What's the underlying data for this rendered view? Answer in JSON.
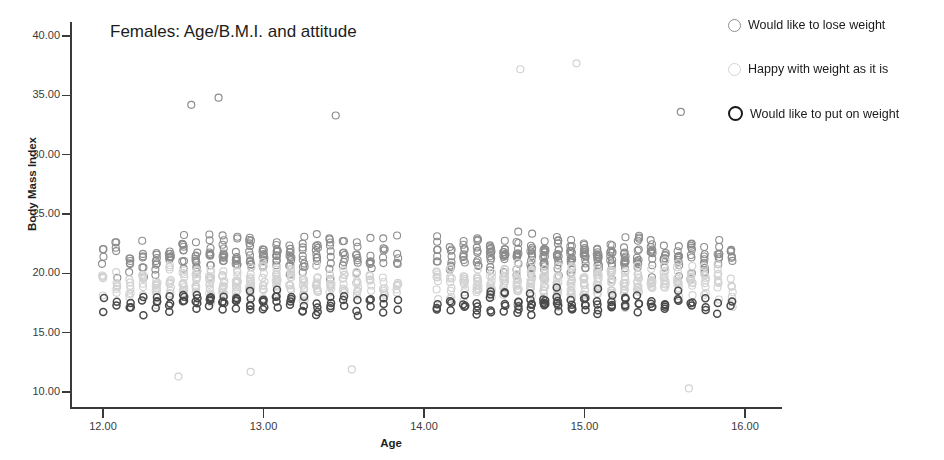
{
  "chart_data": {
    "type": "scatter",
    "title": "Females: Age/B.M.I. and attitude",
    "xlabel": "Age",
    "ylabel": "Body Mass Index",
    "xlim": [
      11.75,
      16.1
    ],
    "ylim": [
      9.0,
      41.5
    ],
    "xticks": [
      "12.00",
      "13.00",
      "14.00",
      "15.00",
      "16.00"
    ],
    "xtick_values": [
      12,
      13,
      14,
      15,
      16
    ],
    "yticks": [
      "10.00",
      "15.00",
      "20.00",
      "25.00",
      "30.00",
      "35.00",
      "40.00"
    ],
    "ytick_values": [
      10,
      15,
      20,
      25,
      30,
      35,
      40
    ],
    "grid": false,
    "legend_position": "right",
    "legend": [
      {
        "label": "Would like to lose weight",
        "marker": "open-circle",
        "color": "#8d8d8d"
      },
      {
        "label": "Happy with weight as it is",
        "marker": "open-circle",
        "color": "#d2d2d2"
      },
      {
        "label": "Would like to put on weight",
        "marker": "open-circle-bold",
        "color": "#1a1a1a"
      }
    ],
    "series": [
      {
        "name": "Would like to lose weight",
        "color": "#8d8d8d",
        "marker_size": 7,
        "n": 470,
        "x_column_centres": [
          12.0,
          12.083,
          12.167,
          12.25,
          12.333,
          12.417,
          12.5,
          12.583,
          12.667,
          12.75,
          12.833,
          12.917,
          13.0,
          13.083,
          13.167,
          13.25,
          13.333,
          13.417,
          13.5,
          13.583,
          13.667,
          13.75,
          13.833,
          14.083,
          14.167,
          14.25,
          14.333,
          14.417,
          14.5,
          14.583,
          14.667,
          14.75,
          14.833,
          14.917,
          15.0,
          15.083,
          15.167,
          15.25,
          15.333,
          15.417,
          15.5,
          15.583,
          15.667,
          15.75,
          15.833,
          15.917
        ],
        "counts_per_column": [
          4,
          5,
          6,
          7,
          8,
          9,
          10,
          11,
          11,
          12,
          12,
          13,
          12,
          12,
          11,
          10,
          10,
          9,
          8,
          8,
          7,
          6,
          5,
          7,
          8,
          9,
          10,
          12,
          13,
          14,
          15,
          16,
          16,
          15,
          15,
          14,
          14,
          13,
          13,
          12,
          11,
          11,
          10,
          9,
          8,
          6
        ],
        "y_range_per_column": [
          17.0,
          31.0
        ],
        "y_median_approx": 21.5
      },
      {
        "name": "Happy with weight as it is",
        "color": "#d2d2d2",
        "marker_size": 7,
        "n": 560,
        "x_column_centres": [
          12.0,
          12.083,
          12.167,
          12.25,
          12.333,
          12.417,
          12.5,
          12.583,
          12.667,
          12.75,
          12.833,
          12.917,
          13.0,
          13.083,
          13.167,
          13.25,
          13.333,
          13.417,
          13.5,
          13.583,
          13.667,
          13.75,
          13.833,
          14.083,
          14.167,
          14.25,
          14.333,
          14.417,
          14.5,
          14.583,
          14.667,
          14.75,
          14.833,
          14.917,
          15.0,
          15.083,
          15.167,
          15.25,
          15.333,
          15.417,
          15.5,
          15.583,
          15.667,
          15.75,
          15.833,
          15.917
        ],
        "counts_per_column": [
          5,
          6,
          7,
          9,
          10,
          11,
          12,
          13,
          13,
          14,
          14,
          15,
          14,
          14,
          13,
          12,
          12,
          11,
          10,
          9,
          8,
          7,
          6,
          8,
          10,
          11,
          12,
          14,
          15,
          16,
          17,
          18,
          18,
          17,
          17,
          16,
          16,
          15,
          14,
          13,
          12,
          12,
          11,
          10,
          9,
          7
        ],
        "y_range_per_column": [
          13.0,
          27.0
        ],
        "y_median_approx": 19.2
      },
      {
        "name": "Would like to put on weight",
        "color": "#4a4a4a",
        "marker_size": 7,
        "n": 190,
        "x_column_centres": [
          12.0,
          12.083,
          12.167,
          12.25,
          12.333,
          12.417,
          12.5,
          12.583,
          12.667,
          12.75,
          12.833,
          12.917,
          13.0,
          13.083,
          13.167,
          13.25,
          13.333,
          13.417,
          13.5,
          13.583,
          13.667,
          13.75,
          13.833,
          14.083,
          14.167,
          14.25,
          14.333,
          14.417,
          14.5,
          14.583,
          14.667,
          14.75,
          14.833,
          14.917,
          15.0,
          15.083,
          15.167,
          15.25,
          15.333,
          15.417,
          15.5,
          15.583,
          15.667,
          15.75,
          15.833,
          15.917
        ],
        "counts_per_column": [
          2,
          2,
          3,
          3,
          4,
          4,
          4,
          5,
          5,
          5,
          5,
          5,
          5,
          5,
          4,
          4,
          4,
          4,
          3,
          3,
          3,
          3,
          2,
          3,
          3,
          4,
          4,
          5,
          5,
          5,
          6,
          6,
          6,
          5,
          5,
          5,
          5,
          4,
          4,
          4,
          4,
          3,
          3,
          3,
          2,
          2
        ],
        "y_range_per_column": [
          12.0,
          22.0
        ],
        "y_median_approx": 17.5
      }
    ],
    "notable_outliers": [
      {
        "x": 14.6,
        "y": 37.2,
        "series": "Happy with weight as it is"
      },
      {
        "x": 14.95,
        "y": 37.7,
        "series": "Happy with weight as it is"
      },
      {
        "x": 12.55,
        "y": 34.2,
        "series": "Would like to lose weight"
      },
      {
        "x": 12.72,
        "y": 34.8,
        "series": "Would like to lose weight"
      },
      {
        "x": 13.45,
        "y": 33.3,
        "series": "Would like to lose weight"
      },
      {
        "x": 15.6,
        "y": 33.6,
        "series": "Would like to lose weight"
      },
      {
        "x": 15.65,
        "y": 10.3,
        "series": "Happy with weight as it is"
      },
      {
        "x": 12.47,
        "y": 11.3,
        "series": "Happy with weight as it is"
      },
      {
        "x": 12.92,
        "y": 11.7,
        "series": "Happy with weight as it is"
      },
      {
        "x": 13.55,
        "y": 11.9,
        "series": "Happy with weight as it is"
      }
    ],
    "data_gap": {
      "from": 13.9,
      "to": 14.07,
      "note": "no observations between 13.9 and 14.05"
    }
  }
}
